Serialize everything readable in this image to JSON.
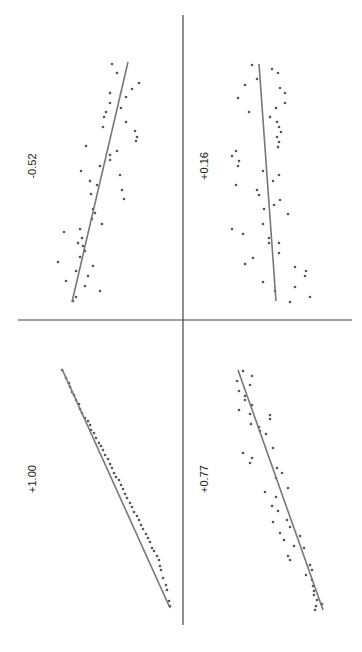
{
  "figure": {
    "orientation": "rotated-90",
    "axis_color": "#444444",
    "fit_line_color": "#777777",
    "point_color": "#555555"
  },
  "chart_data": [
    {
      "type": "scatter",
      "panel": "top-left",
      "title": "-0.52",
      "correlation": -0.52,
      "fit_line": {
        "x1": 72,
        "y1": 302,
        "x2": 128,
        "y2": 62
      },
      "points": [
        [
          112,
          64
        ],
        [
          117,
          73
        ],
        [
          139,
          83
        ],
        [
          132,
          89
        ],
        [
          110,
          93
        ],
        [
          126,
          97
        ],
        [
          110,
          103
        ],
        [
          121,
          108
        ],
        [
          106,
          112
        ],
        [
          104,
          117
        ],
        [
          103,
          127
        ],
        [
          126,
          122
        ],
        [
          135,
          131
        ],
        [
          137,
          137
        ],
        [
          136,
          141
        ],
        [
          86,
          146
        ],
        [
          117,
          151
        ],
        [
          110,
          155
        ],
        [
          110,
          160
        ],
        [
          100,
          166
        ],
        [
          81,
          171
        ],
        [
          120,
          175
        ],
        [
          90,
          181
        ],
        [
          97,
          185
        ],
        [
          122,
          190
        ],
        [
          124,
          199
        ],
        [
          91,
          194
        ],
        [
          93,
          209
        ],
        [
          95,
          213
        ],
        [
          92,
          219
        ],
        [
          102,
          224
        ],
        [
          80,
          229
        ],
        [
          64,
          232
        ],
        [
          82,
          238
        ],
        [
          78,
          243
        ],
        [
          83,
          246
        ],
        [
          85,
          251
        ],
        [
          80,
          257
        ],
        [
          58,
          262
        ],
        [
          76,
          271
        ],
        [
          93,
          266
        ],
        [
          88,
          276
        ],
        [
          66,
          281
        ],
        [
          85,
          286
        ],
        [
          100,
          291
        ],
        [
          76,
          297
        ],
        [
          73,
          301
        ]
      ]
    },
    {
      "type": "scatter",
      "panel": "top-right",
      "title": "+0.16",
      "correlation": 0.16,
      "fit_line": {
        "x1": 259,
        "y1": 64,
        "x2": 276,
        "y2": 301
      },
      "points": [
        [
          252,
          65
        ],
        [
          272,
          69
        ],
        [
          278,
          73
        ],
        [
          257,
          79
        ],
        [
          245,
          85
        ],
        [
          280,
          88
        ],
        [
          285,
          93
        ],
        [
          238,
          98
        ],
        [
          285,
          103
        ],
        [
          276,
          108
        ],
        [
          249,
          112
        ],
        [
          270,
          117
        ],
        [
          277,
          122
        ],
        [
          279,
          127
        ],
        [
          281,
          132
        ],
        [
          277,
          137
        ],
        [
          279,
          142
        ],
        [
          278,
          147
        ],
        [
          236,
          151
        ],
        [
          232,
          156
        ],
        [
          239,
          161
        ],
        [
          238,
          166
        ],
        [
          263,
          171
        ],
        [
          279,
          175
        ],
        [
          273,
          181
        ],
        [
          236,
          185
        ],
        [
          257,
          190
        ],
        [
          259,
          195
        ],
        [
          280,
          200
        ],
        [
          274,
          205
        ],
        [
          264,
          209
        ],
        [
          288,
          214
        ],
        [
          263,
          224
        ],
        [
          232,
          229
        ],
        [
          243,
          234
        ],
        [
          269,
          238
        ],
        [
          269,
          243
        ],
        [
          279,
          243
        ],
        [
          279,
          253
        ],
        [
          253,
          258
        ],
        [
          245,
          264
        ],
        [
          295,
          267
        ],
        [
          306,
          271
        ],
        [
          305,
          276
        ],
        [
          263,
          282
        ],
        [
          295,
          287
        ],
        [
          275,
          291
        ],
        [
          310,
          297
        ],
        [
          290,
          302
        ]
      ]
    },
    {
      "type": "scatter",
      "panel": "bottom-left",
      "title": "+1.00",
      "correlation": 1.0,
      "fit_line": {
        "x1": 62,
        "y1": 369,
        "x2": 170,
        "y2": 608
      },
      "points": [
        [
          62,
          370
        ],
        [
          66,
          378
        ],
        [
          69,
          383
        ],
        [
          70,
          387
        ],
        [
          72,
          392
        ],
        [
          74,
          395
        ],
        [
          76,
          400
        ],
        [
          79,
          404
        ],
        [
          80,
          409
        ],
        [
          82,
          413
        ],
        [
          85,
          418
        ],
        [
          88,
          421
        ],
        [
          90,
          425
        ],
        [
          91,
          430
        ],
        [
          94,
          433
        ],
        [
          96,
          438
        ],
        [
          99,
          443
        ],
        [
          101,
          446
        ],
        [
          103,
          450
        ],
        [
          105,
          455
        ],
        [
          108,
          459
        ],
        [
          110,
          464
        ],
        [
          112,
          468
        ],
        [
          114,
          473
        ],
        [
          116,
          477
        ],
        [
          119,
          480
        ],
        [
          121,
          485
        ],
        [
          123,
          489
        ],
        [
          125,
          494
        ],
        [
          127,
          498
        ],
        [
          130,
          503
        ],
        [
          132,
          507
        ],
        [
          134,
          512
        ],
        [
          137,
          516
        ],
        [
          139,
          520
        ],
        [
          141,
          525
        ],
        [
          143,
          529
        ],
        [
          146,
          534
        ],
        [
          148,
          538
        ],
        [
          150,
          542
        ],
        [
          152,
          548
        ],
        [
          154,
          551
        ],
        [
          157,
          556
        ],
        [
          159,
          560
        ],
        [
          160,
          566
        ],
        [
          161,
          570
        ],
        [
          163,
          578
        ],
        [
          166,
          585
        ],
        [
          167,
          590
        ],
        [
          169,
          601
        ],
        [
          170,
          606
        ]
      ]
    },
    {
      "type": "scatter",
      "panel": "bottom-right",
      "title": "+0.77",
      "correlation": 0.77,
      "fit_line": {
        "x1": 238,
        "y1": 370,
        "x2": 323,
        "y2": 610
      },
      "points": [
        [
          243,
          371
        ],
        [
          252,
          376
        ],
        [
          237,
          381
        ],
        [
          250,
          385
        ],
        [
          239,
          391
        ],
        [
          245,
          396
        ],
        [
          245,
          400
        ],
        [
          252,
          405
        ],
        [
          239,
          410
        ],
        [
          250,
          414
        ],
        [
          251,
          424
        ],
        [
          259,
          427
        ],
        [
          270,
          415
        ],
        [
          270,
          419
        ],
        [
          260,
          431
        ],
        [
          266,
          434
        ],
        [
          273,
          448
        ],
        [
          243,
          453
        ],
        [
          252,
          458
        ],
        [
          250,
          463
        ],
        [
          277,
          468
        ],
        [
          282,
          473
        ],
        [
          276,
          478
        ],
        [
          288,
          488
        ],
        [
          265,
          492
        ],
        [
          276,
          497
        ],
        [
          272,
          506
        ],
        [
          278,
          511
        ],
        [
          287,
          520
        ],
        [
          273,
          522
        ],
        [
          290,
          527
        ],
        [
          280,
          533
        ],
        [
          284,
          540
        ],
        [
          300,
          536
        ],
        [
          294,
          546
        ],
        [
          304,
          548
        ],
        [
          288,
          556
        ],
        [
          290,
          560
        ],
        [
          310,
          565
        ],
        [
          312,
          570
        ],
        [
          312,
          580
        ],
        [
          306,
          575
        ],
        [
          313,
          586
        ],
        [
          314,
          591
        ],
        [
          314,
          595
        ],
        [
          317,
          600
        ],
        [
          316,
          606
        ],
        [
          322,
          604
        ],
        [
          315,
          610
        ]
      ]
    }
  ],
  "axes": {
    "horizontal": {
      "x1": 18,
      "y1": 320,
      "x2": 352,
      "y2": 320
    },
    "vertical": {
      "x1": 183,
      "y1": 15,
      "x2": 183,
      "y2": 625
    }
  },
  "labels": [
    {
      "text": "-0.52",
      "x": 36,
      "y": 166
    },
    {
      "text": "+0.16",
      "x": 208,
      "y": 166
    },
    {
      "text": "+1.00",
      "x": 36,
      "y": 479
    },
    {
      "text": "+0.77",
      "x": 208,
      "y": 479
    }
  ]
}
